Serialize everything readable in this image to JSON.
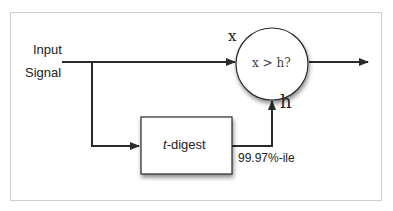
{
  "diagram": {
    "input_label_line1": "Input",
    "input_label_line2": "Signal",
    "x_label": "x",
    "comparator_text": "x > h?",
    "h_label": "h",
    "digest_label_italic": "t",
    "digest_label_rest": "-digest",
    "percentile_label": "99.97%-ile",
    "colors": {
      "line": "#2a2a2a",
      "frame": "#cfcfcf",
      "background": "#ffffff"
    }
  }
}
